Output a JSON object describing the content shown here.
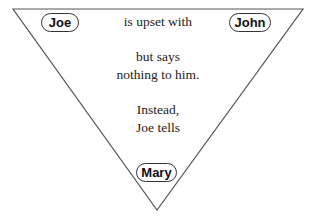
{
  "diagram": {
    "type": "inverted-triangle",
    "nodes": {
      "top_left": "Joe",
      "top_right": "John",
      "bottom": "Mary"
    },
    "text": {
      "line1": "is upset with",
      "line2a": "but says",
      "line2b": "nothing to him.",
      "line3a": "Instead,",
      "line3b": "Joe tells"
    },
    "colors": {
      "line": "#555555",
      "text": "#222222"
    }
  }
}
